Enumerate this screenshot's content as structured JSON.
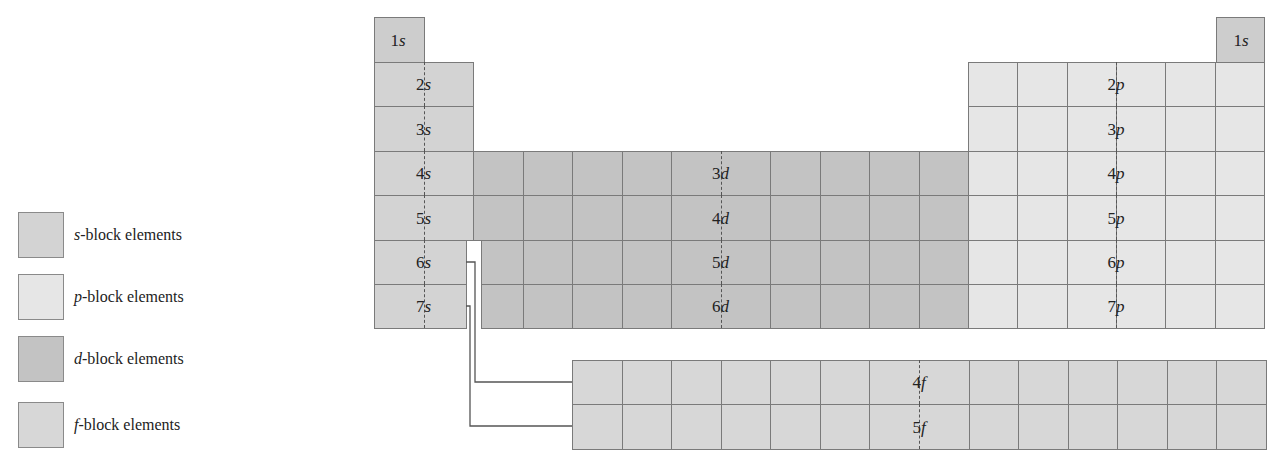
{
  "colors": {
    "s_block": "#d3d3d3",
    "p_block": "#e6e6e6",
    "d_block": "#c3c3c3",
    "f_block": "#d7d7d7",
    "s_top": "#cdcdcd",
    "border": "#7a7a7a"
  },
  "legend": [
    {
      "letter": "s",
      "text": "-block elements",
      "color": "#d3d3d3"
    },
    {
      "letter": "p",
      "text": "-block elements",
      "color": "#e6e6e6"
    },
    {
      "letter": "d",
      "text": "-block elements",
      "color": "#c3c3c3"
    },
    {
      "letter": "f",
      "text": "-block elements",
      "color": "#d7d7d7"
    }
  ],
  "s_block": {
    "labels": [
      {
        "n": "1",
        "l": "s"
      },
      {
        "n": "2",
        "l": "s"
      },
      {
        "n": "3",
        "l": "s"
      },
      {
        "n": "4",
        "l": "s"
      },
      {
        "n": "5",
        "l": "s"
      },
      {
        "n": "6",
        "l": "s"
      },
      {
        "n": "7",
        "l": "s"
      }
    ]
  },
  "helium": {
    "n": "1",
    "l": "s"
  },
  "p_block": {
    "labels": [
      {
        "n": "2",
        "l": "p"
      },
      {
        "n": "3",
        "l": "p"
      },
      {
        "n": "4",
        "l": "p"
      },
      {
        "n": "5",
        "l": "p"
      },
      {
        "n": "6",
        "l": "p"
      },
      {
        "n": "7",
        "l": "p"
      }
    ]
  },
  "d_block": {
    "labels": [
      {
        "n": "3",
        "l": "d"
      },
      {
        "n": "4",
        "l": "d"
      },
      {
        "n": "5",
        "l": "d"
      },
      {
        "n": "6",
        "l": "d"
      }
    ]
  },
  "f_block": {
    "labels": [
      {
        "n": "4",
        "l": "f"
      },
      {
        "n": "5",
        "l": "f"
      }
    ]
  }
}
